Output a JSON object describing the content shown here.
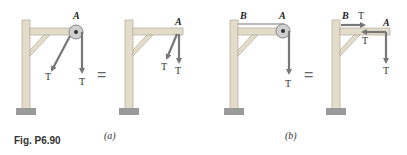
{
  "figure": {
    "caption": "Fig. P6.90",
    "panels": [
      {
        "id": "a",
        "label": "(a)",
        "left_diagram": {
          "point_label": "A",
          "force_labels": [
            "T",
            "T"
          ],
          "element": "pulley-at-A"
        },
        "equals": "=",
        "right_diagram": {
          "point_label": "A",
          "force_labels": [
            "T",
            "T"
          ]
        }
      },
      {
        "id": "b",
        "label": "(b)",
        "left_diagram": {
          "point_labels": [
            "B",
            "A"
          ],
          "force_labels": [
            "T"
          ],
          "element": "pulley-at-A-cable-to-B"
        },
        "equals": "=",
        "right_diagram": {
          "point_labels": [
            "B",
            "A"
          ],
          "force_labels": [
            "T",
            "T",
            "T"
          ]
        }
      }
    ]
  },
  "colors": {
    "wood": "#e3dccb",
    "wood_edge": "#b9b1a0",
    "arrow": "#7a7a7a",
    "base": "#9a9a9a"
  }
}
